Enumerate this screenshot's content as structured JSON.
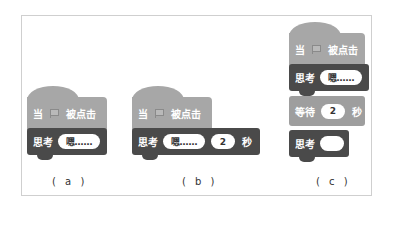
{
  "panels": [
    {
      "id": "a",
      "label": "( a )",
      "hat": {
        "prefix": "当",
        "flag_icon": "green-flag-icon",
        "suffix": "被点击"
      },
      "blocks": [
        {
          "category": "looks",
          "keyword": "思考",
          "input": "嗯……"
        }
      ]
    },
    {
      "id": "b",
      "label": "( b )",
      "hat": {
        "prefix": "当",
        "flag_icon": "green-flag-icon",
        "suffix": "被点击"
      },
      "blocks": [
        {
          "category": "looks",
          "keyword": "思考",
          "input": "嗯……",
          "seconds": "2",
          "unit": "秒"
        }
      ]
    },
    {
      "id": "c",
      "label": "( c )",
      "hat": {
        "prefix": "当",
        "flag_icon": "green-flag-icon",
        "suffix": "被点击"
      },
      "blocks": [
        {
          "category": "looks",
          "keyword": "思考",
          "input": "嗯……"
        },
        {
          "category": "control",
          "keyword": "等待",
          "input": "2",
          "unit": "秒"
        },
        {
          "category": "looks",
          "keyword": "思考",
          "input": ""
        }
      ]
    }
  ],
  "colors": {
    "hat": "#a7a7a7",
    "looks": "#4a4a4a",
    "control": "#9e9e9e",
    "frame": "#cfcfcf"
  }
}
